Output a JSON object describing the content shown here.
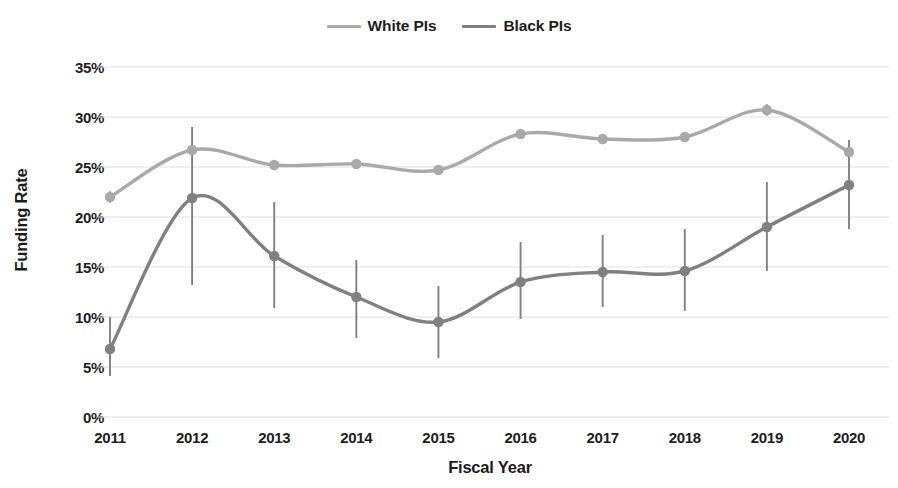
{
  "chart_data": {
    "type": "line",
    "title": "",
    "xlabel": "Fiscal Year",
    "ylabel": "Funding Rate",
    "categories": [
      "2011",
      "2012",
      "2013",
      "2014",
      "2015",
      "2016",
      "2017",
      "2018",
      "2019",
      "2020"
    ],
    "x": [
      2011,
      2012,
      2013,
      2014,
      2015,
      2016,
      2017,
      2018,
      2019,
      2020
    ],
    "ylim": [
      0,
      35
    ],
    "yticks": [
      0,
      5,
      10,
      15,
      20,
      25,
      30,
      35
    ],
    "ytick_labels": [
      "0%",
      "5%",
      "10%",
      "15%",
      "20%",
      "25%",
      "30%",
      "35%"
    ],
    "grid": true,
    "grid_axis": "y",
    "legend_position": "top-center",
    "smoothed_lines": true,
    "error_bars": true,
    "series": [
      {
        "name": "White PIs",
        "color": "#a9a9a9",
        "values": [
          22.0,
          26.7,
          25.2,
          25.3,
          24.7,
          28.3,
          27.8,
          28.0,
          30.7,
          26.5
        ],
        "err_low": [
          21.4,
          26.1,
          24.7,
          24.8,
          24.2,
          27.8,
          27.3,
          27.5,
          30.1,
          25.9
        ],
        "err_high": [
          22.6,
          27.3,
          25.7,
          25.8,
          25.2,
          28.8,
          28.3,
          28.5,
          31.3,
          27.1
        ]
      },
      {
        "name": "Black PIs",
        "color": "#808080",
        "values": [
          6.8,
          21.9,
          16.1,
          12.0,
          9.5,
          13.5,
          14.5,
          14.6,
          19.0,
          23.2
        ],
        "err_low": [
          4.1,
          13.2,
          10.9,
          7.9,
          5.9,
          9.8,
          11.0,
          10.6,
          14.6,
          18.8
        ],
        "err_high": [
          10.0,
          29.0,
          21.5,
          15.7,
          13.1,
          17.5,
          18.2,
          18.8,
          23.5,
          27.7
        ]
      }
    ]
  },
  "legend": {
    "items": [
      {
        "label": "White PIs",
        "color": "#a9a9a9",
        "name": "legend-white-pis"
      },
      {
        "label": "Black PIs",
        "color": "#808080",
        "name": "legend-black-pis"
      }
    ]
  },
  "axes": {
    "y_title": "Funding Rate",
    "x_title": "Fiscal Year"
  }
}
